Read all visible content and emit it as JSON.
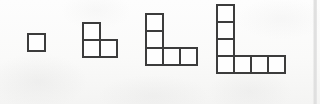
{
  "figure": {
    "background_color": "#fcfcfb",
    "outline_color": "#3c3c3c",
    "cell_fill_color": "#fefefe",
    "cell_size": 19,
    "border_width": 2,
    "count": 4
  },
  "chart_data": {
    "type": "diagram",
    "categories": [
      "Figure 1",
      "Figure 2",
      "Figure 3",
      "Figure 4"
    ],
    "values": [
      1,
      3,
      5,
      7
    ],
    "series": [
      {
        "name": "Squares in figure",
        "values": [
          1,
          3,
          5,
          7
        ]
      },
      {
        "name": "Vertical arm length",
        "values": [
          1,
          2,
          3,
          4
        ]
      },
      {
        "name": "Horizontal arm length",
        "values": [
          1,
          2,
          3,
          4
        ]
      }
    ],
    "xlabel": "Figure number",
    "ylabel": "Number of unit squares",
    "rule": "n-th figure has 2n - 1 squares",
    "grid": false,
    "legend": "none"
  },
  "right_margin_rule": {
    "x": 313,
    "color": "#dcdcdc"
  },
  "figures": [
    {
      "name": "figure-1",
      "label": "Figure 1",
      "square_count": 1,
      "arm_vertical": 1,
      "arm_horizontal": 1,
      "left": 27,
      "top": 33,
      "cells": [
        {
          "col": 0,
          "row": 0
        }
      ]
    },
    {
      "name": "figure-2",
      "label": "Figure 2",
      "square_count": 3,
      "arm_vertical": 2,
      "arm_horizontal": 2,
      "left": 82,
      "top": 22,
      "cells": [
        {
          "col": 0,
          "row": 0
        },
        {
          "col": 0,
          "row": 1
        },
        {
          "col": 1,
          "row": 1
        }
      ]
    },
    {
      "name": "figure-3",
      "label": "Figure 3",
      "square_count": 5,
      "arm_vertical": 3,
      "arm_horizontal": 3,
      "left": 145,
      "top": 13,
      "cells": [
        {
          "col": 0,
          "row": 0
        },
        {
          "col": 0,
          "row": 1
        },
        {
          "col": 0,
          "row": 2
        },
        {
          "col": 1,
          "row": 2
        },
        {
          "col": 2,
          "row": 2
        }
      ]
    },
    {
      "name": "figure-4",
      "label": "Figure 4",
      "square_count": 7,
      "arm_vertical": 4,
      "arm_horizontal": 4,
      "left": 216,
      "top": 4,
      "cells": [
        {
          "col": 0,
          "row": 0
        },
        {
          "col": 0,
          "row": 1
        },
        {
          "col": 0,
          "row": 2
        },
        {
          "col": 0,
          "row": 3
        },
        {
          "col": 1,
          "row": 3
        },
        {
          "col": 2,
          "row": 3
        },
        {
          "col": 3,
          "row": 3
        }
      ]
    }
  ]
}
